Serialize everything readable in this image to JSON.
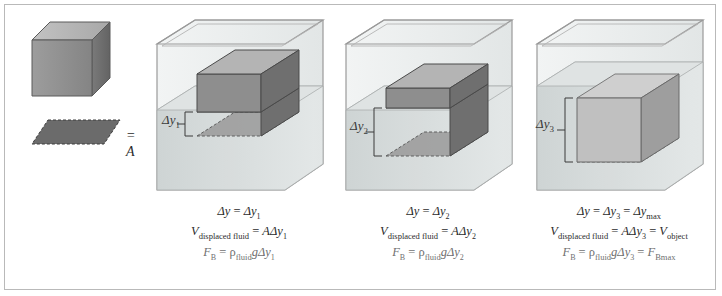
{
  "figure": {
    "border_color": "#b9b9b9",
    "background": "#ffffff"
  },
  "legend": {
    "cube_name": "reference-cube",
    "area_symbol": "= A",
    "area_label": "A",
    "description": "shaded parallelogram equals cross-sectional area A"
  },
  "colors": {
    "cube_top": "#b4b4b4",
    "cube_front": "#8e8e8e",
    "cube_side": "#6f6f6f",
    "cube_outline": "#4a4a4a",
    "area_fill": "#6b6b6b",
    "water": "#d8dcdc",
    "glass": "#e9ecec",
    "glass_line": "#9a9a9a",
    "text": "#2b2b2b",
    "faint_text": "#8a8a8a"
  },
  "panels": [
    {
      "id": "panel-1",
      "depth_label": "Δy",
      "depth_sub": "1",
      "submersion_fraction": 0.28,
      "equations": {
        "depth": {
          "lhs": "Δy",
          "rhs": "Δy",
          "rhs_sub": "1"
        },
        "volume": {
          "lhs": "V",
          "lhs_sub": "displaced fluid",
          "rhs": "AΔy",
          "rhs_sub": "1"
        },
        "force": {
          "lhs": "F",
          "lhs_sub": "B",
          "rho": "ρ",
          "rho_sub": "fluid",
          "g": "g",
          "rhs": "Δy",
          "rhs_sub": "1"
        }
      }
    },
    {
      "id": "panel-2",
      "depth_label": "Δy",
      "depth_sub": "2",
      "submersion_fraction": 0.62,
      "equations": {
        "depth": {
          "lhs": "Δy",
          "rhs": "Δy",
          "rhs_sub": "2"
        },
        "volume": {
          "lhs": "V",
          "lhs_sub": "displaced fluid",
          "rhs": "AΔy",
          "rhs_sub": "2"
        },
        "force": {
          "lhs": "F",
          "lhs_sub": "B",
          "rho": "ρ",
          "rho_sub": "fluid",
          "g": "g",
          "rhs": "Δy",
          "rhs_sub": "2"
        }
      }
    },
    {
      "id": "panel-3",
      "depth_label": "Δy",
      "depth_sub": "3",
      "submersion_fraction": 1.0,
      "equations": {
        "depth": {
          "lhs": "Δy",
          "rhs": "Δy",
          "rhs_sub": "3",
          "extra": "Δy",
          "extra_sub": "max"
        },
        "volume": {
          "lhs": "V",
          "lhs_sub": "displaced fluid",
          "rhs": "AΔy",
          "rhs_sub": "3",
          "extra": "V",
          "extra_sub": "object"
        },
        "force": {
          "lhs": "F",
          "lhs_sub": "B",
          "rho": "ρ",
          "rho_sub": "fluid",
          "g": "g",
          "rhs": "Δy",
          "rhs_sub": "3",
          "extra": "F",
          "extra_sub": "Bmax"
        }
      }
    }
  ]
}
